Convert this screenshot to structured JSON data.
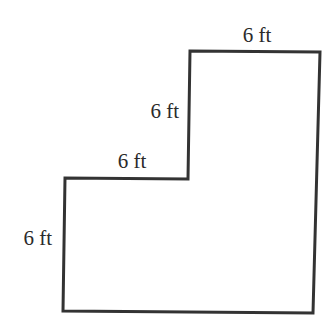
{
  "figure": {
    "type": "L-shaped polygon (composite rectangle figure)",
    "stroke_color": "#333333",
    "background": "#ffffff",
    "outline_points": [
      [
        190,
        51
      ],
      [
        320,
        52
      ],
      [
        313,
        313
      ],
      [
        63,
        311
      ],
      [
        65,
        178
      ],
      [
        188,
        179
      ]
    ],
    "labels": {
      "top_edge": "6 ft",
      "upper_left_vertical_edge": "6 ft",
      "middle_horizontal_edge": "6 ft",
      "lower_left_vertical_edge": "6 ft"
    }
  }
}
